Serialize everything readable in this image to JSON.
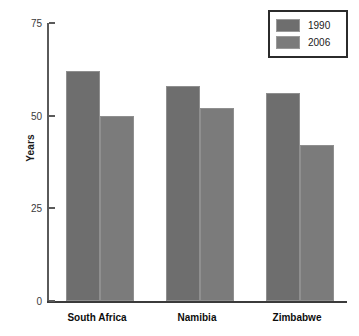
{
  "chart_data": {
    "type": "bar",
    "title": "",
    "xlabel": "",
    "ylabel": "Years",
    "ylim": [
      0,
      75
    ],
    "yticks": [
      0,
      25,
      50,
      75
    ],
    "ytick_labels": [
      "0",
      "25",
      "50",
      "75"
    ],
    "grid": false,
    "legend_position": "top-right",
    "categories": [
      "South Africa",
      "Namibia",
      "Zimbabwe"
    ],
    "series": [
      {
        "name": "1990",
        "color": "#6e6e6e",
        "values": [
          62,
          58,
          56
        ]
      },
      {
        "name": "2006",
        "color": "#7b7b7b",
        "values": [
          50,
          52,
          42
        ]
      }
    ]
  },
  "axis": {
    "y_title": "Years",
    "ticks": [
      {
        "label": "75",
        "value": 75
      },
      {
        "label": "50",
        "value": 50
      },
      {
        "label": "25",
        "value": 25
      },
      {
        "label": "0",
        "value": 0
      }
    ]
  },
  "legend": {
    "entries": [
      {
        "label": "1990",
        "color": "#6e6e6e"
      },
      {
        "label": "2006",
        "color": "#7b7b7b"
      }
    ]
  },
  "categories": [
    {
      "label": "South Africa"
    },
    {
      "label": "Namibia"
    },
    {
      "label": "Zimbabwe"
    }
  ]
}
